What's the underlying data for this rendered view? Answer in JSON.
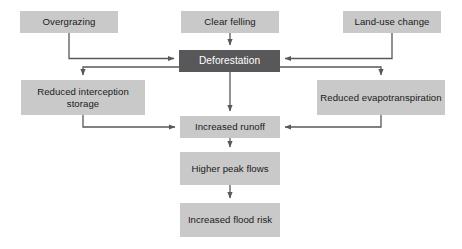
{
  "diagram": {
    "type": "flowchart",
    "background_color": "#ffffff",
    "node_fill": "#c9c9c9",
    "node_fill_highlight": "#58585a",
    "node_text_color": "#1a1a1a",
    "node_text_color_highlight": "#ffffff",
    "connector_color": "#58585a",
    "nodes": [
      {
        "id": "overgrazing",
        "label": "Overgrazing",
        "x": 20,
        "y": 11,
        "w": 98,
        "h": 22,
        "style": "light"
      },
      {
        "id": "clear_felling",
        "label": "Clear felling",
        "x": 181,
        "y": 11,
        "w": 98,
        "h": 22,
        "style": "light"
      },
      {
        "id": "land_use_change",
        "label": "Land-use change",
        "x": 343,
        "y": 11,
        "w": 98,
        "h": 22,
        "style": "light"
      },
      {
        "id": "deforestation",
        "label": "Deforestation",
        "x": 179,
        "y": 50,
        "w": 101,
        "h": 22,
        "style": "dark"
      },
      {
        "id": "reduced_interception_storage",
        "label": "Reduced interception storage",
        "x": 21,
        "y": 80,
        "w": 124,
        "h": 35,
        "style": "light"
      },
      {
        "id": "reduced_evapotranspiration",
        "label": "Reduced evapotranspiration",
        "x": 317,
        "y": 80,
        "w": 128,
        "h": 35,
        "style": "light"
      },
      {
        "id": "increased_runoff",
        "label": "Increased runoff",
        "x": 180,
        "y": 116,
        "w": 100,
        "h": 22,
        "style": "light"
      },
      {
        "id": "higher_peak_flows",
        "label": "Higher peak flows",
        "x": 180,
        "y": 152,
        "w": 100,
        "h": 33,
        "style": "light"
      },
      {
        "id": "increased_flood_risk",
        "label": "Increased flood risk",
        "x": 180,
        "y": 203,
        "w": 100,
        "h": 34,
        "style": "light"
      }
    ],
    "edges": [
      {
        "id": "overgrazing-to-deforestation",
        "from": "overgrazing",
        "to": "deforestation",
        "path": "M 69 33 L 69 58.5 L 174 58.5",
        "arrow": "right"
      },
      {
        "id": "clear-felling-to-deforestation",
        "from": "clear_felling",
        "to": "deforestation",
        "path": "M 230 33 L 230 45",
        "arrow": "down"
      },
      {
        "id": "land-use-change-to-deforestation",
        "from": "land_use_change",
        "to": "deforestation",
        "path": "M 392 33 L 392 58.5 L 285 58.5",
        "arrow": "left"
      },
      {
        "id": "deforestation-to-reduced-interception",
        "from": "deforestation",
        "to": "reduced_interception_storage",
        "path": "M 179 67 L 83 67 L 83 75",
        "arrow": "down"
      },
      {
        "id": "deforestation-to-reduced-evapotranspiration",
        "from": "deforestation",
        "to": "reduced_evapotranspiration",
        "path": "M 280 67 L 381 67 L 381 75",
        "arrow": "down"
      },
      {
        "id": "deforestation-to-increased-runoff",
        "from": "deforestation",
        "to": "increased_runoff",
        "path": "M 230 72 L 230 111",
        "arrow": "down"
      },
      {
        "id": "reduced-interception-to-increased-runoff",
        "from": "reduced_interception_storage",
        "to": "increased_runoff",
        "path": "M 83 115 L 83 127 L 175 127",
        "arrow": "right"
      },
      {
        "id": "reduced-evapotranspiration-to-increased-runoff",
        "from": "reduced_evapotranspiration",
        "to": "increased_runoff",
        "path": "M 381 115 L 381 127 L 285 127",
        "arrow": "left"
      },
      {
        "id": "increased-runoff-to-higher-peak-flows",
        "from": "increased_runoff",
        "to": "higher_peak_flows",
        "path": "M 230 138 L 230 147",
        "arrow": "down"
      },
      {
        "id": "higher-peak-flows-to-increased-flood-risk",
        "from": "higher_peak_flows",
        "to": "increased_flood_risk",
        "path": "M 230 185 L 230 198",
        "arrow": "down"
      }
    ]
  }
}
